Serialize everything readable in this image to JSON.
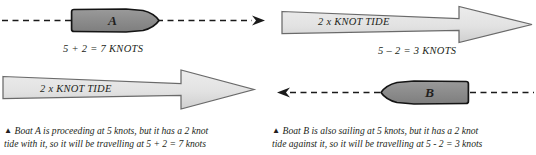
{
  "diagram": {
    "title_semantics": "tide-effect-on-boat-speed",
    "colors": {
      "boat_fill": "#8c8c8c",
      "boat_stroke": "#1a1a1a",
      "tide_fill_top": "#e8e8e8",
      "tide_fill_bottom": "#d3d3d3",
      "tide_stroke": "#6e6e6e",
      "line": "#1a1a1a",
      "text": "#231f20"
    },
    "panels": [
      {
        "id": "boat-a",
        "boat_letter": "A",
        "boat_direction": "right",
        "course_line": "dashed",
        "speed_label": "5 + 2 = 7 KNOTS",
        "tide_label": "2 x KNOT TIDE",
        "tide_direction": "right",
        "caption_marker": "▲",
        "caption_line1": "Boat A is proceeding at 5 knots, but it has a 2 knot",
        "caption_line2": "tide with it, so it will be travelling at 5 + 2 = 7 knots"
      },
      {
        "id": "boat-b",
        "boat_letter": "B",
        "boat_direction": "left",
        "course_line": "dashed",
        "speed_label": "5 – 2 = 3 KNOTS",
        "tide_label": "2 x KNOT TIDE",
        "tide_direction": "right",
        "caption_marker": "▲",
        "caption_line1": "Boat B is also sailing at 5 knots, but it has a 2 knot",
        "caption_line2": "tide against it, so it will be travelling at 5 - 2 = 3 knots"
      }
    ]
  }
}
